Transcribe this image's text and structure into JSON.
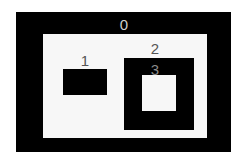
{
  "diagram": {
    "colors": {
      "background": "#ffffff",
      "filled": "#000000",
      "hole": "#f7f7f7",
      "label_on_light": "#555555",
      "label_on_dark": "#cfcfcf"
    },
    "regions": [
      {
        "id": 0,
        "label": "0",
        "fill": "black",
        "outer": {
          "x": 16,
          "y": 12,
          "w": 215,
          "h": 140
        },
        "hole": {
          "x": 43,
          "y": 34,
          "w": 164,
          "h": 104
        },
        "label_pos": {
          "x": 124,
          "y": 17
        }
      },
      {
        "id": 1,
        "label": "1",
        "fill": "black",
        "outer": {
          "x": 63,
          "y": 69,
          "w": 44,
          "h": 26
        },
        "label_pos": {
          "x": 85,
          "y": 53
        }
      },
      {
        "id": 2,
        "label": "2",
        "fill": "black",
        "outer": {
          "x": 124,
          "y": 58,
          "w": 70,
          "h": 72
        },
        "label_pos": {
          "x": 155,
          "y": 41
        }
      },
      {
        "id": 3,
        "label": "3",
        "fill": "white",
        "outer": {
          "x": 142,
          "y": 75,
          "w": 34,
          "h": 36
        },
        "label_pos": {
          "x": 155,
          "y": 62
        }
      }
    ]
  }
}
